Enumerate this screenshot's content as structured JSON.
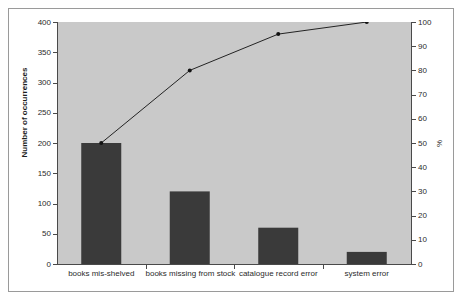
{
  "chart_data": {
    "type": "bar",
    "title": "",
    "subtitle": "",
    "xlabel": "",
    "ylabel": "Number of occurrences",
    "y2label": "%",
    "categories": [
      "books mis-shelved",
      "books missing from stock",
      "catalogue record error",
      "system error"
    ],
    "series": [
      {
        "name": "Number of occurrences",
        "type": "bar",
        "axis": "left",
        "values": [
          200,
          120,
          60,
          20
        ]
      },
      {
        "name": "Cumulative percentage",
        "type": "line",
        "axis": "right",
        "values": [
          50,
          80,
          95,
          100
        ]
      }
    ],
    "ylim": [
      0,
      400
    ],
    "y2lim": [
      0,
      100
    ],
    "yticks": [
      0,
      50,
      100,
      150,
      200,
      250,
      300,
      350,
      400
    ],
    "y2ticks": [
      0,
      10,
      20,
      30,
      40,
      50,
      60,
      70,
      80,
      90,
      100
    ],
    "ytick_labels": [
      "0",
      "50",
      "100",
      "150",
      "200",
      "250",
      "300",
      "350",
      "400"
    ],
    "y2tick_labels": [
      "0",
      "10",
      "20",
      "30",
      "40",
      "50",
      "60",
      "70",
      "80",
      "90",
      "100"
    ],
    "grid": false,
    "legend": "none",
    "colors": {
      "bar": "#3a3a3a",
      "line": "#232323",
      "marker": "#121212",
      "plot_background": "#c9c9c9",
      "figure_background": "#ffffff",
      "axis": "#4a4a4a",
      "frame": "#9a9a9a",
      "text": "#2b2b2b"
    }
  }
}
